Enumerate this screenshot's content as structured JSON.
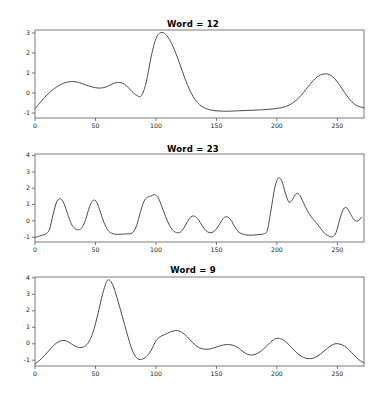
{
  "figure": {
    "background_color": "#ffffff",
    "line_color": "#4c4c4c",
    "axis_color": "#6e6e6e",
    "text_color": "#1a1a1a"
  },
  "subplots": [
    {
      "title": "Word = 12",
      "xticks": [
        "0",
        "50",
        "100",
        "150",
        "200",
        "250"
      ],
      "yticks": [
        "-1",
        "0",
        "1",
        "2",
        "3"
      ]
    },
    {
      "title": "Word = 23",
      "xticks": [
        "0",
        "50",
        "100",
        "150",
        "200",
        "250"
      ],
      "yticks": [
        "-1",
        "0",
        "1",
        "2",
        "3",
        "4"
      ]
    },
    {
      "title": "Word = 9",
      "xticks": [
        "0",
        "50",
        "100",
        "150",
        "200",
        "250"
      ],
      "yticks": [
        "-1",
        "0",
        "1",
        "2",
        "3",
        "4"
      ]
    }
  ],
  "chart_data": [
    {
      "type": "line",
      "title": "Word = 12",
      "xlabel": "",
      "ylabel": "",
      "xlim": [
        0,
        272
      ],
      "ylim": [
        -1.25,
        3.15
      ],
      "xticks": [
        0,
        50,
        100,
        150,
        200,
        250
      ],
      "yticks": [
        -1,
        0,
        1,
        2,
        3
      ],
      "grid": false,
      "legend": false,
      "series": [
        {
          "name": "Word = 12",
          "x": [
            0,
            4,
            8,
            12,
            16,
            20,
            24,
            28,
            32,
            36,
            40,
            44,
            48,
            52,
            56,
            60,
            64,
            68,
            72,
            76,
            80,
            84,
            88,
            92,
            96,
            100,
            104,
            108,
            112,
            116,
            120,
            124,
            128,
            132,
            136,
            140,
            144,
            148,
            152,
            156,
            160,
            164,
            168,
            172,
            176,
            180,
            184,
            188,
            192,
            196,
            200,
            204,
            208,
            212,
            216,
            220,
            224,
            228,
            232,
            236,
            240,
            244,
            248,
            252,
            256,
            260,
            264,
            268,
            272
          ],
          "y": [
            -0.78,
            -0.5,
            -0.22,
            0.02,
            0.22,
            0.38,
            0.5,
            0.56,
            0.57,
            0.53,
            0.45,
            0.36,
            0.29,
            0.25,
            0.26,
            0.33,
            0.45,
            0.53,
            0.5,
            0.34,
            0.08,
            -0.12,
            -0.13,
            0.55,
            1.8,
            2.72,
            3.02,
            2.93,
            2.58,
            2.06,
            1.4,
            0.72,
            0.14,
            -0.3,
            -0.58,
            -0.74,
            -0.83,
            -0.88,
            -0.9,
            -0.91,
            -0.91,
            -0.9,
            -0.89,
            -0.88,
            -0.87,
            -0.86,
            -0.85,
            -0.84,
            -0.82,
            -0.8,
            -0.77,
            -0.73,
            -0.66,
            -0.54,
            -0.36,
            -0.12,
            0.18,
            0.48,
            0.74,
            0.9,
            0.96,
            0.9,
            0.7,
            0.38,
            0.02,
            -0.3,
            -0.55,
            -0.68,
            -0.73
          ]
        }
      ]
    },
    {
      "type": "line",
      "title": "Word = 23",
      "xlabel": "",
      "ylabel": "",
      "xlim": [
        0,
        272
      ],
      "ylim": [
        -1.3,
        4.1
      ],
      "xticks": [
        0,
        50,
        100,
        150,
        200,
        250
      ],
      "yticks": [
        -1,
        0,
        1,
        2,
        3,
        4
      ],
      "grid": false,
      "legend": false,
      "series": [
        {
          "name": "Word = 23",
          "x": [
            0,
            3,
            6,
            9,
            12,
            15,
            18,
            21,
            24,
            27,
            30,
            33,
            36,
            39,
            42,
            45,
            48,
            51,
            54,
            57,
            60,
            63,
            66,
            69,
            72,
            75,
            78,
            81,
            84,
            87,
            90,
            93,
            96,
            99,
            102,
            105,
            108,
            111,
            114,
            117,
            120,
            123,
            126,
            129,
            132,
            135,
            138,
            141,
            144,
            147,
            150,
            153,
            156,
            159,
            162,
            165,
            168,
            171,
            174,
            177,
            180,
            183,
            186,
            189,
            192,
            195,
            198,
            201,
            204,
            207,
            210,
            213,
            216,
            219,
            222,
            225,
            228,
            231,
            234,
            237,
            240,
            243,
            246,
            249,
            252,
            255,
            258,
            261,
            264,
            267,
            270
          ],
          "y": [
            -1.02,
            -0.95,
            -0.88,
            -0.8,
            -0.52,
            0.4,
            1.18,
            1.35,
            1.05,
            0.4,
            -0.18,
            -0.48,
            -0.55,
            -0.4,
            0.1,
            0.85,
            1.25,
            1.15,
            0.55,
            -0.1,
            -0.55,
            -0.75,
            -0.82,
            -0.83,
            -0.82,
            -0.8,
            -0.8,
            -0.7,
            -0.3,
            0.5,
            1.18,
            1.45,
            1.52,
            1.6,
            1.4,
            0.85,
            0.25,
            -0.25,
            -0.58,
            -0.72,
            -0.7,
            -0.45,
            -0.05,
            0.25,
            0.28,
            0.08,
            -0.28,
            -0.58,
            -0.72,
            -0.7,
            -0.5,
            -0.15,
            0.18,
            0.24,
            0.05,
            -0.35,
            -0.65,
            -0.8,
            -0.86,
            -0.88,
            -0.88,
            -0.86,
            -0.84,
            -0.8,
            -0.6,
            0.6,
            1.95,
            2.62,
            2.45,
            1.7,
            1.15,
            1.32,
            1.68,
            1.55,
            1.1,
            0.65,
            0.28,
            0.0,
            -0.25,
            -0.55,
            -0.8,
            -0.94,
            -0.98,
            -0.7,
            0.1,
            0.72,
            0.78,
            0.4,
            0.05,
            0.0,
            0.22,
            0.4,
            0.2,
            0.05,
            0.28,
            1.3,
            2.9,
            3.9,
            3.82,
            2.6,
            1.3,
            0.55,
            0.1,
            -0.2,
            -0.38,
            -0.48,
            -0.52,
            -0.55,
            -0.58,
            -0.62,
            -0.7,
            -0.82,
            -0.95,
            -1.05
          ]
        }
      ]
    },
    {
      "type": "line",
      "title": "Word = 9",
      "xlabel": "",
      "ylabel": "",
      "xlim": [
        0,
        272
      ],
      "ylim": [
        -1.35,
        4.05
      ],
      "xticks": [
        0,
        50,
        100,
        150,
        200,
        250
      ],
      "yticks": [
        -1,
        0,
        1,
        2,
        3,
        4
      ],
      "grid": false,
      "legend": false,
      "series": [
        {
          "name": "Word = 9",
          "x": [
            0,
            4,
            8,
            12,
            16,
            20,
            24,
            28,
            32,
            36,
            40,
            44,
            48,
            52,
            56,
            60,
            64,
            68,
            72,
            76,
            80,
            84,
            88,
            92,
            96,
            100,
            104,
            108,
            112,
            116,
            120,
            124,
            128,
            132,
            136,
            140,
            144,
            148,
            152,
            156,
            160,
            164,
            168,
            172,
            176,
            180,
            184,
            188,
            192,
            196,
            200,
            204,
            208,
            212,
            216,
            220,
            224,
            228,
            232,
            236,
            240,
            244,
            248,
            252,
            256,
            260,
            264,
            268,
            272
          ],
          "y": [
            -1.22,
            -1.0,
            -0.7,
            -0.38,
            -0.06,
            0.14,
            0.2,
            0.1,
            -0.1,
            -0.22,
            -0.2,
            0.05,
            0.7,
            1.8,
            3.05,
            3.85,
            3.62,
            2.75,
            1.7,
            0.65,
            -0.32,
            -0.85,
            -0.95,
            -0.78,
            -0.4,
            0.18,
            0.45,
            0.58,
            0.72,
            0.8,
            0.75,
            0.55,
            0.25,
            -0.05,
            -0.25,
            -0.33,
            -0.32,
            -0.25,
            -0.15,
            -0.07,
            -0.05,
            -0.1,
            -0.25,
            -0.48,
            -0.65,
            -0.68,
            -0.58,
            -0.38,
            -0.1,
            0.18,
            0.33,
            0.28,
            0.08,
            -0.22,
            -0.52,
            -0.75,
            -0.88,
            -0.9,
            -0.82,
            -0.62,
            -0.38,
            -0.15,
            0.0,
            -0.02,
            -0.15,
            -0.4,
            -0.7,
            -0.98,
            -1.15
          ]
        }
      ]
    }
  ]
}
